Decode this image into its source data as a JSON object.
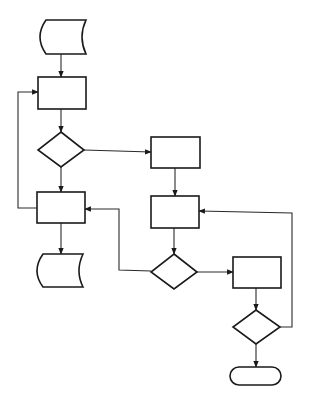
{
  "diagram": {
    "type": "flowchart",
    "colors": {
      "stroke": "#1a1a1a",
      "background": "#ffffff"
    },
    "nodes": [
      {
        "id": "input-data",
        "shape": "stored-data",
        "label": ""
      },
      {
        "id": "process-1",
        "shape": "rectangle",
        "label": ""
      },
      {
        "id": "decision-1",
        "shape": "diamond",
        "label": ""
      },
      {
        "id": "process-2",
        "shape": "rectangle",
        "label": ""
      },
      {
        "id": "output-data",
        "shape": "stored-data",
        "label": ""
      },
      {
        "id": "process-3",
        "shape": "rectangle",
        "label": ""
      },
      {
        "id": "process-4",
        "shape": "rectangle",
        "label": ""
      },
      {
        "id": "decision-2",
        "shape": "diamond",
        "label": ""
      },
      {
        "id": "process-5",
        "shape": "rectangle",
        "label": ""
      },
      {
        "id": "decision-3",
        "shape": "diamond",
        "label": ""
      },
      {
        "id": "end",
        "shape": "terminator",
        "label": ""
      }
    ],
    "edges": [
      {
        "from": "input-data",
        "to": "process-1"
      },
      {
        "from": "process-1",
        "to": "decision-1"
      },
      {
        "from": "decision-1",
        "to": "process-2"
      },
      {
        "from": "decision-1",
        "to": "process-3"
      },
      {
        "from": "process-2",
        "to": "process-1",
        "kind": "loop"
      },
      {
        "from": "process-2",
        "to": "output-data"
      },
      {
        "from": "process-3",
        "to": "process-4"
      },
      {
        "from": "process-4",
        "to": "decision-2"
      },
      {
        "from": "decision-2",
        "to": "process-2"
      },
      {
        "from": "decision-2",
        "to": "process-5"
      },
      {
        "from": "process-5",
        "to": "decision-3"
      },
      {
        "from": "decision-3",
        "to": "process-4",
        "kind": "loop"
      },
      {
        "from": "decision-3",
        "to": "end"
      }
    ]
  }
}
